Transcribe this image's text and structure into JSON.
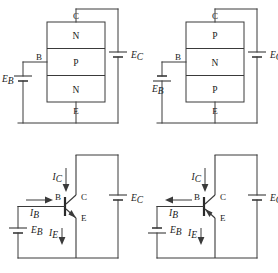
{
  "figure": {
    "stroke_color": "#3a3a3a",
    "text_color": "#1a1a1a",
    "background": "#ffffff"
  },
  "panels": [
    {
      "id": "npn-block",
      "position": "top-left",
      "kind": "block-structure",
      "device": "NPN",
      "layers": [
        {
          "label": "N",
          "region": "collector"
        },
        {
          "label": "P",
          "region": "base"
        },
        {
          "label": "N",
          "region": "emitter"
        }
      ],
      "terminals": {
        "collector": "C",
        "base": "B",
        "emitter": "E"
      },
      "sources": [
        {
          "name": "base-supply",
          "label": "E",
          "subscript": "B",
          "side": "left",
          "polarity": "positive-top"
        },
        {
          "name": "collector-supply",
          "label": "E",
          "subscript": "C",
          "side": "right",
          "polarity": "positive-top"
        }
      ]
    },
    {
      "id": "pnp-block",
      "position": "top-right",
      "kind": "block-structure",
      "device": "PNP",
      "layers": [
        {
          "label": "P",
          "region": "collector"
        },
        {
          "label": "N",
          "region": "base"
        },
        {
          "label": "P",
          "region": "emitter"
        }
      ],
      "terminals": {
        "collector": "C",
        "base": "B",
        "emitter": "E"
      },
      "sources": [
        {
          "name": "base-supply",
          "label": "E",
          "subscript": "B",
          "side": "left",
          "polarity": "negative-top"
        },
        {
          "name": "collector-supply",
          "label": "E",
          "subscript": "C",
          "side": "right",
          "polarity": "positive-top"
        }
      ]
    },
    {
      "id": "npn-symbol",
      "position": "bottom-left",
      "kind": "schematic-symbol",
      "device": "NPN",
      "terminals": {
        "collector": "C",
        "base": "B",
        "emitter": "E"
      },
      "emitter_arrow": "out-of-base",
      "currents": [
        {
          "label": "I",
          "subscript": "C",
          "name": "collector-current",
          "direction": "down"
        },
        {
          "label": "I",
          "subscript": "B",
          "name": "base-current",
          "direction": "right"
        },
        {
          "label": "I",
          "subscript": "E",
          "name": "emitter-current",
          "direction": "down"
        }
      ],
      "sources": [
        {
          "name": "base-supply",
          "label": "E",
          "subscript": "B",
          "side": "left",
          "polarity": "positive-top"
        },
        {
          "name": "collector-supply",
          "label": "E",
          "subscript": "C",
          "side": "right",
          "polarity": "positive-top"
        }
      ]
    },
    {
      "id": "pnp-symbol",
      "position": "bottom-right",
      "kind": "schematic-symbol",
      "device": "PNP",
      "terminals": {
        "collector": "C",
        "base": "B",
        "emitter": "E"
      },
      "emitter_arrow": "into-base",
      "currents": [
        {
          "label": "I",
          "subscript": "C",
          "name": "collector-current",
          "direction": "down"
        },
        {
          "label": "I",
          "subscript": "B",
          "name": "base-current",
          "direction": "left"
        },
        {
          "label": "I",
          "subscript": "E",
          "name": "emitter-current",
          "direction": "down"
        }
      ],
      "sources": [
        {
          "name": "base-supply",
          "label": "E",
          "subscript": "B",
          "side": "left",
          "polarity": "negative-top"
        },
        {
          "name": "collector-supply",
          "label": "E",
          "subscript": "C",
          "side": "right",
          "polarity": "positive-top"
        }
      ]
    }
  ]
}
